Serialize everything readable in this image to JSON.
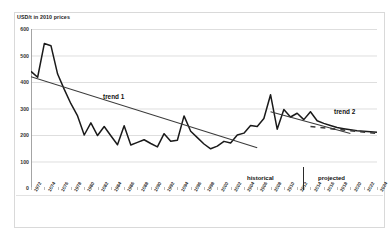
{
  "chart_data": {
    "type": "line",
    "title": "",
    "ylabel": "USD/t in 2010 prices",
    "xlabel": "",
    "ylim": [
      0,
      600
    ],
    "yticks": [
      0,
      100,
      200,
      300,
      400,
      500,
      600
    ],
    "grid": true,
    "legend": "none",
    "categories": [
      "1972",
      "1973",
      "1974",
      "1975",
      "1976",
      "1977",
      "1978",
      "1979",
      "1980",
      "1981",
      "1982",
      "1983",
      "1984",
      "1985",
      "1986",
      "1987",
      "1988",
      "1989",
      "1990",
      "1991",
      "1992",
      "1993",
      "1994",
      "1995",
      "1996",
      "1997",
      "1998",
      "1999",
      "2000",
      "2001",
      "2002",
      "2003",
      "2004",
      "2005",
      "2006",
      "2007",
      "2008",
      "2009",
      "2010",
      "2011",
      "2012",
      "2013",
      "2014",
      "2015",
      "2016",
      "2017",
      "2018",
      "2019",
      "2020",
      "2021",
      "2022",
      "2023",
      "2024"
    ],
    "series": [
      {
        "name": "price",
        "values": [
          440,
          418,
          545,
          537,
          430,
          372,
          318,
          272,
          200,
          246,
          198,
          232,
          197,
          163,
          235,
          162,
          172,
          182,
          168,
          155,
          205,
          176,
          180,
          272,
          214,
          190,
          166,
          148,
          158,
          176,
          170,
          200,
          207,
          236,
          232,
          262,
          352,
          222,
          296,
          268,
          282,
          258,
          288,
          254,
          244,
          236,
          228,
          224,
          220,
          216,
          214,
          212,
          210
        ]
      }
    ],
    "annotations": [
      {
        "id": "trend1",
        "label": "trend 1",
        "type": "trendline-label"
      },
      {
        "id": "trend2",
        "label": "trend 2",
        "type": "trendline-label"
      },
      {
        "id": "historical",
        "label": "historical",
        "type": "region-label"
      },
      {
        "id": "projected",
        "label": "projected",
        "type": "region-label"
      }
    ],
    "trendlines": [
      {
        "name": "trend 1",
        "style": "solid",
        "x0_year": "1972",
        "y0": 420,
        "x1_year": "2006",
        "y1": 152
      },
      {
        "name": "trend 2",
        "style": "solid",
        "x0_year": "2008",
        "y0": 288,
        "x1_year": "2020",
        "y1": 206
      },
      {
        "name": "trend 2 projection",
        "style": "dashed",
        "x0_year": "2014",
        "y0": 232,
        "x1_year": "2024",
        "y1": 206
      }
    ],
    "divider": {
      "label_left": "historical",
      "label_right": "projected",
      "at_year": "2012"
    },
    "colors": {
      "series": "#1a1a1a",
      "trend": "#3a3a3a",
      "grid": "#d0d0d0",
      "frame": "#d9d9d9"
    }
  }
}
